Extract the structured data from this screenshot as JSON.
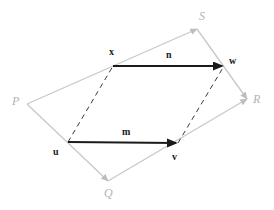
{
  "figure": {
    "background_color": "#ffffff",
    "outer_color": "#c8c8c8",
    "inner_color": "#1a1a1a",
    "dashed_color": "#333333",
    "width": 274,
    "height": 210,
    "outer_quad": {
      "name": "PQRS",
      "vertices": [
        {
          "key": "P",
          "label": "P",
          "x": 27,
          "y": 104,
          "label_x": 12,
          "label_y": 95,
          "arrowhead": false
        },
        {
          "key": "Q",
          "label": "Q",
          "x": 108,
          "y": 181,
          "label_x": 104,
          "label_y": 187,
          "arrowhead": true
        },
        {
          "key": "R",
          "label": "R",
          "x": 247,
          "y": 99,
          "label_x": 253,
          "label_y": 93,
          "arrowhead": true
        },
        {
          "key": "S",
          "label": "S",
          "x": 197,
          "y": 29,
          "label_x": 199,
          "label_y": 10,
          "arrowhead": true
        }
      ],
      "edges": [
        {
          "from": "P",
          "to": "Q",
          "arrow_at_end": true
        },
        {
          "from": "Q",
          "to": "R",
          "arrow_at_end": true
        },
        {
          "from": "P",
          "to": "S",
          "arrow_at_end": true
        },
        {
          "from": "S",
          "to": "R",
          "arrow_at_end": true
        }
      ]
    },
    "vectors": [
      {
        "key": "m",
        "label": "m",
        "tail_point": "u",
        "head_point": "v",
        "x1": 68,
        "y1": 142,
        "x2": 178,
        "y2": 143,
        "label_x": 122,
        "label_y": 127
      },
      {
        "key": "n",
        "label": "n",
        "tail_point": "x",
        "head_point": "w",
        "x1": 113,
        "y1": 66,
        "x2": 224,
        "y2": 66,
        "label_x": 166,
        "label_y": 50
      }
    ],
    "points": [
      {
        "key": "u",
        "label": "u",
        "x": 68,
        "y": 142,
        "label_x": 53,
        "label_y": 147
      },
      {
        "key": "v",
        "label": "v",
        "x": 178,
        "y": 143,
        "label_x": 172,
        "label_y": 152
      },
      {
        "key": "x",
        "label": "x",
        "x": 113,
        "y": 66,
        "label_x": 109,
        "label_y": 47
      },
      {
        "key": "w",
        "label": "w",
        "x": 224,
        "y": 66,
        "label_x": 229,
        "label_y": 56
      }
    ],
    "dashed_segments": [
      {
        "name": "u-to-x",
        "from": "u",
        "to": "x",
        "x1": 68,
        "y1": 142,
        "x2": 113,
        "y2": 66
      },
      {
        "name": "v-to-w",
        "from": "v",
        "to": "w",
        "x1": 178,
        "y1": 143,
        "x2": 224,
        "y2": 66
      }
    ]
  }
}
